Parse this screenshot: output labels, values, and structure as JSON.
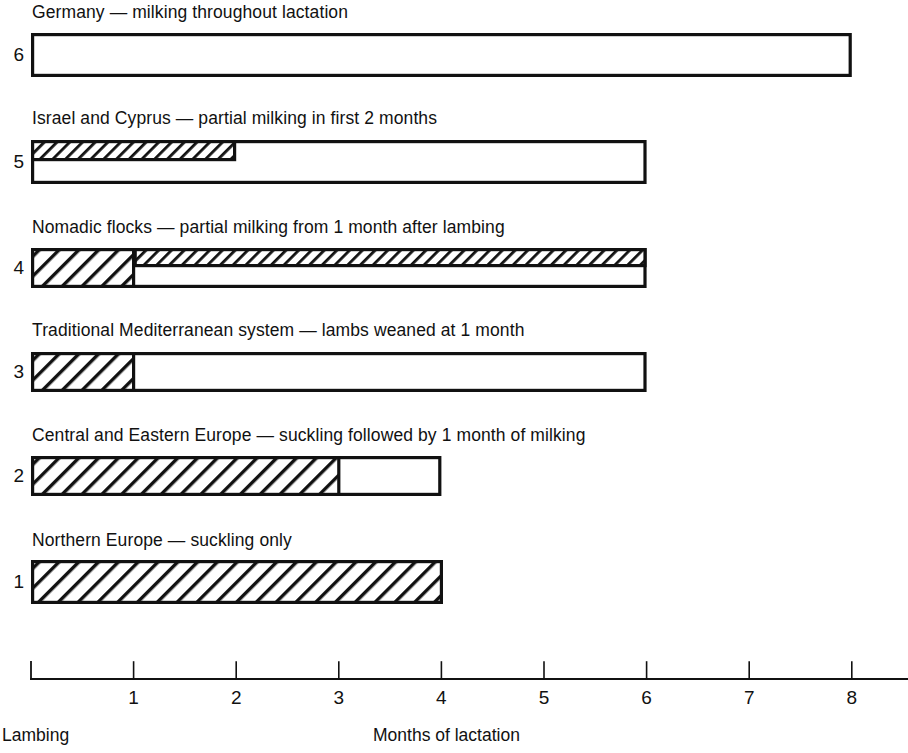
{
  "chart_data": {
    "type": "bar",
    "title": "",
    "subtitle": "",
    "xlabel": "Months of lactation",
    "ylabel": "",
    "xlim": [
      0,
      8.55
    ],
    "ylim": [
      0.5,
      6.5
    ],
    "grid": false,
    "legend": "none",
    "orientation": "horizontal",
    "x_tick_labels": [
      "1",
      "2",
      "3",
      "4",
      "5",
      "6",
      "7",
      "8"
    ],
    "x_tick_values": [
      1,
      2,
      3,
      4,
      5,
      6,
      7,
      8
    ],
    "origin_label": "Lambing",
    "axis_note": "Months of lactation",
    "categories": [
      "1",
      "2",
      "3",
      "4",
      "5",
      "6"
    ],
    "series": [
      {
        "name": "Total lactation span (months)",
        "values": [
          4,
          4,
          6,
          6,
          6,
          8
        ]
      },
      {
        "name": "Suckling period (months, full hatch)",
        "values": [
          4,
          3,
          1,
          1,
          0,
          0
        ]
      },
      {
        "name": "Partial milking period (months, half hatch)",
        "values": [
          0,
          0,
          0,
          5,
          2,
          0
        ]
      }
    ],
    "rows": [
      {
        "number": "6",
        "caption": "Germany — milking throughout lactation",
        "bar_start": 0,
        "bar_end": 8,
        "full_hatch_start": 0,
        "full_hatch_end": 0,
        "half_hatch_start": 0,
        "half_hatch_end": 0
      },
      {
        "number": "5",
        "caption": "Israel and Cyprus — partial milking in first 2 months",
        "bar_start": 0,
        "bar_end": 6,
        "full_hatch_start": 0,
        "full_hatch_end": 0,
        "half_hatch_start": 0,
        "half_hatch_end": 2
      },
      {
        "number": "4",
        "caption": "Nomadic flocks — partial milking from 1 month after lambing",
        "bar_start": 0,
        "bar_end": 6,
        "full_hatch_start": 0,
        "full_hatch_end": 1,
        "half_hatch_start": 1,
        "half_hatch_end": 6
      },
      {
        "number": "3",
        "caption": "Traditional Mediterranean system — lambs weaned at 1 month",
        "bar_start": 0,
        "bar_end": 6,
        "full_hatch_start": 0,
        "full_hatch_end": 1,
        "half_hatch_start": 0,
        "half_hatch_end": 0
      },
      {
        "number": "2",
        "caption": "Central and Eastern Europe — suckling followed by 1 month of milking",
        "bar_start": 0,
        "bar_end": 4,
        "full_hatch_start": 0,
        "full_hatch_end": 3,
        "half_hatch_start": 0,
        "half_hatch_end": 0
      },
      {
        "number": "1",
        "caption": "Northern Europe — suckling only",
        "bar_start": 0,
        "bar_end": 4,
        "full_hatch_start": 0,
        "full_hatch_end": 4,
        "half_hatch_start": 0,
        "half_hatch_end": 0
      }
    ],
    "colors": {
      "ink": "#111111",
      "bar_fill": "#ffffff",
      "hatch": "#111111",
      "background": "#ffffff"
    }
  },
  "footer": {
    "origin_label": "Lambing",
    "axis_label": "Months of lactation"
  }
}
